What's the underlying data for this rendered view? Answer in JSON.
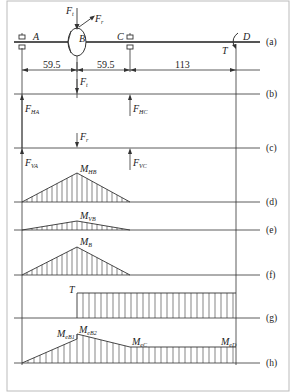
{
  "colors": {
    "line": "#333333",
    "shaft": "#555555",
    "frame": "#bbbbbb",
    "background": "#ffffff"
  },
  "shaft": {
    "points": {
      "A": "A",
      "B": "B",
      "C": "C",
      "D": "D"
    },
    "forces": {
      "Ft": "F",
      "Ft_sub": "t",
      "Fr": "F",
      "Fr_sub": "r"
    },
    "torque": "T",
    "dimensions": [
      "59.5",
      "59.5",
      "113"
    ]
  },
  "panels": {
    "a": "(a)",
    "b": "(b)",
    "c": "(c)",
    "d": "(d)",
    "e": "(e)",
    "f": "(f)",
    "g": "(g)",
    "h": "(h)"
  },
  "panel_b": {
    "load": {
      "main": "F",
      "sub": "t"
    },
    "reaction_A": {
      "main": "F",
      "sub": "HA"
    },
    "reaction_C": {
      "main": "F",
      "sub": "HC"
    }
  },
  "panel_c": {
    "load": {
      "main": "F",
      "sub": "r"
    },
    "reaction_A": {
      "main": "F",
      "sub": "VA"
    },
    "reaction_C": {
      "main": "F",
      "sub": "VC"
    }
  },
  "panel_d": {
    "label": {
      "main": "M",
      "sub": "HB"
    }
  },
  "panel_e": {
    "label": {
      "main": "M",
      "sub": "VB"
    }
  },
  "panel_f": {
    "label": {
      "main": "M",
      "sub": "B"
    }
  },
  "panel_g": {
    "label": {
      "main": "T",
      "sub": ""
    }
  },
  "panel_h": {
    "labels": [
      {
        "main": "M",
        "sub": "eB1"
      },
      {
        "main": "M",
        "sub": "eB2"
      },
      {
        "main": "M",
        "sub": "eC"
      },
      {
        "main": "M",
        "sub": "eD"
      }
    ]
  }
}
